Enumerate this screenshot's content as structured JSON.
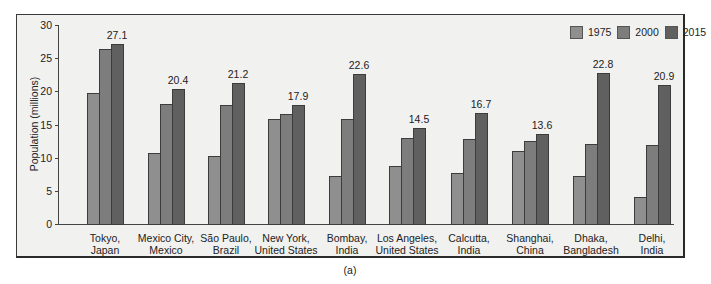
{
  "chart_data": {
    "type": "bar",
    "title": "",
    "caption": "(a)",
    "xlabel": "",
    "ylabel": "Population (millions)",
    "ylim": [
      0,
      30
    ],
    "yticks": [
      "0",
      "5",
      "10",
      "15",
      "20",
      "25",
      "30"
    ],
    "grid": false,
    "legend_position": "top-right",
    "categories": [
      "Tokyo, Japan",
      "Mexico City, Mexico",
      "São Paulo, Brazil",
      "New York, United States",
      "Bombay, India",
      "Los Angeles, United States",
      "Calcutta, India",
      "Shanghai, China",
      "Dhaka, Bangladesh",
      "Delhi, India"
    ],
    "category_lines": [
      [
        "Tokyo,",
        "Japan"
      ],
      [
        "Mexico City,",
        "Mexico"
      ],
      [
        "São Paulo,",
        "Brazil"
      ],
      [
        "New York,",
        "United States"
      ],
      [
        "Bombay,",
        "India"
      ],
      [
        "Los Angeles,",
        "United States"
      ],
      [
        "Calcutta,",
        "India"
      ],
      [
        "Shanghai,",
        "China"
      ],
      [
        "Dhaka,",
        "Bangladesh"
      ],
      [
        "Delhi,",
        "India"
      ]
    ],
    "series": [
      {
        "name": "1975",
        "color": "#8f8f8f",
        "values": [
          19.8,
          10.7,
          10.3,
          15.8,
          7.2,
          8.7,
          7.7,
          11.0,
          7.2,
          4.0
        ]
      },
      {
        "name": "2000",
        "color": "#7d7d7d",
        "values": [
          26.4,
          18.1,
          17.9,
          16.6,
          15.8,
          13.0,
          12.8,
          12.5,
          12.1,
          11.9
        ]
      },
      {
        "name": "2015",
        "color": "#606060",
        "values": [
          27.1,
          20.4,
          21.2,
          17.9,
          22.6,
          14.5,
          16.7,
          13.6,
          22.8,
          20.9
        ]
      }
    ],
    "data_labels_2015": [
      "27.1",
      "20.4",
      "21.2",
      "17.9",
      "22.6",
      "14.5",
      "16.7",
      "13.6",
      "22.8",
      "20.9"
    ]
  }
}
